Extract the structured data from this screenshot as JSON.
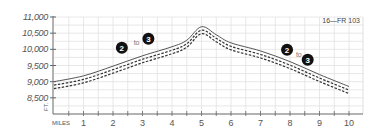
{
  "chart_data": {
    "type": "line",
    "title": "",
    "route_label": "16—FR 103",
    "xlabel": "MILES",
    "ylabel": "FT.",
    "x_ticks": [
      "1",
      "2",
      "3",
      "4",
      "5",
      "6",
      "7",
      "8",
      "9",
      "10"
    ],
    "y_ticks": [
      "11,000",
      "10,500",
      "10,000",
      "9,500",
      "9,000",
      "8,500"
    ],
    "xlim": [
      0,
      10.5
    ],
    "ylim": [
      8000,
      11000
    ],
    "grid": true,
    "series": [
      {
        "name": "elevation profile",
        "x": [
          0,
          1,
          2,
          3,
          4,
          4.5,
          5,
          5.5,
          6,
          7,
          8,
          9,
          10
        ],
        "y": [
          9000,
          9180,
          9480,
          9800,
          10080,
          10280,
          10700,
          10450,
          10200,
          9950,
          9620,
          9220,
          8850
        ]
      }
    ],
    "annotations": [
      {
        "type": "marker",
        "label": "2",
        "x": 2.3,
        "y": 10050
      },
      {
        "type": "text",
        "label": "to",
        "x": 2.8,
        "y": 10200
      },
      {
        "type": "marker",
        "label": "3",
        "x": 3.2,
        "y": 10330
      },
      {
        "type": "marker",
        "label": "2",
        "x": 7.9,
        "y": 9990
      },
      {
        "type": "text",
        "label": "to",
        "x": 8.3,
        "y": 9820
      },
      {
        "type": "marker",
        "label": "3",
        "x": 8.6,
        "y": 9680
      }
    ]
  }
}
